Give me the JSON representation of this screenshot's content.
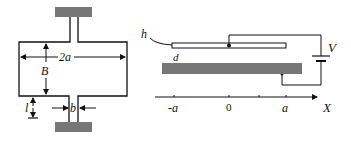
{
  "figure_left": {
    "title": "Waveguide-like cross-section",
    "labels": {
      "width": "2a",
      "height": "B",
      "stem_length": "l",
      "stem_width": "b"
    },
    "colors": {
      "block": "#777777",
      "line": "#111111"
    }
  },
  "figure_right": {
    "labels": {
      "top_plate": "h",
      "gap": "d",
      "voltage": "V",
      "axis": "X"
    },
    "axis_ticks": [
      "-a",
      "0",
      "",
      "a"
    ],
    "colors": {
      "plate": "#777777",
      "line": "#111111"
    }
  }
}
